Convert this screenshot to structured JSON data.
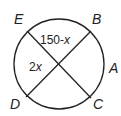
{
  "diagram": {
    "points": {
      "E": "E",
      "B": "B",
      "A": "A",
      "D": "D",
      "C": "C"
    },
    "angles": {
      "top": "150-",
      "top_var": "x",
      "left": "2",
      "left_var": "x"
    }
  }
}
